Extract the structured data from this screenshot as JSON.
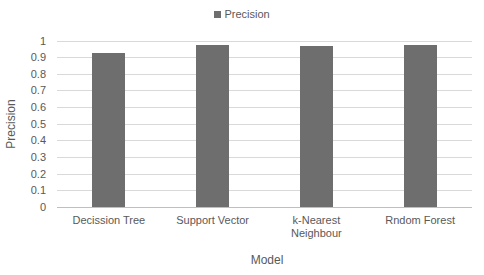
{
  "chart_data": {
    "type": "bar",
    "title": "",
    "categories": [
      "Decission Tree",
      "Support Vector",
      "k-Nearest Neighbour",
      "Rndom Forest"
    ],
    "category_lines": [
      [
        "Decission Tree"
      ],
      [
        "Support Vector"
      ],
      [
        "k-Nearest",
        "Neighbour"
      ],
      [
        "Rndom Forest"
      ]
    ],
    "series": [
      {
        "name": "Precision",
        "color": "#6e6e6e",
        "values": [
          0.925,
          0.97,
          0.965,
          0.975
        ]
      }
    ],
    "xlabel": "Model",
    "ylabel": "Precision",
    "ylim": [
      0,
      1
    ],
    "yticks": [
      "0",
      "0.1",
      "0.2",
      "0.3",
      "0.4",
      "0.5",
      "0.6",
      "0.7",
      "0.8",
      "0.9",
      "1"
    ],
    "grid": true,
    "legend_position": "top"
  },
  "legend": {
    "label": "Precision"
  },
  "axes": {
    "y_title": "Precision",
    "x_title": "Model"
  }
}
